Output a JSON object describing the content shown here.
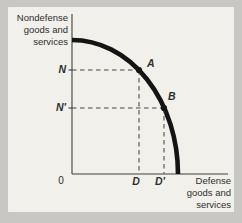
{
  "figure": {
    "y_axis_label": [
      "Nondefense",
      "goods and",
      "services"
    ],
    "x_axis_label": [
      "Defense",
      "goods and",
      "services"
    ],
    "origin_label": "0",
    "y_tick_labels": {
      "n": "N",
      "n_prime": "N'"
    },
    "x_tick_labels": {
      "d": "D",
      "d_prime": "D'"
    },
    "point_labels": {
      "a": "A",
      "b": "B"
    },
    "colors": {
      "curve": "#141414",
      "axis": "#3f3f3f",
      "dash": "#474747",
      "dot": "#141414",
      "panel_bg": "#f1f0ea",
      "outer_bg": "#c8c7c3",
      "text": "#2e2e2e"
    },
    "geometry": {
      "axes": {
        "origin_x": 72,
        "origin_y": 174,
        "y_top": 14,
        "x_right": 228
      },
      "curve": {
        "start_x": 72,
        "start_y": 40,
        "rx": 106,
        "ry": 134,
        "end_x": 178,
        "end_y": 174
      },
      "points": {
        "a": {
          "x": 139,
          "y": 70
        },
        "b": {
          "x": 164,
          "y": 108
        }
      },
      "dot_radius": 3.1,
      "tick_len": 3.5
    }
  },
  "chart_data": {
    "type": "line",
    "title": "",
    "xlabel": "Defense goods and services",
    "ylabel": "Nondefense goods and services",
    "x_ticks": [
      "0",
      "D",
      "D'"
    ],
    "y_ticks": [
      "N",
      "N'"
    ],
    "axis_range_norm": [
      0,
      1
    ],
    "frontier_points_norm": [
      [
        0.0,
        0.84
      ],
      [
        0.17,
        0.81
      ],
      [
        0.33,
        0.73
      ],
      [
        0.43,
        0.65
      ],
      [
        0.52,
        0.53
      ],
      [
        0.59,
        0.41
      ],
      [
        0.64,
        0.28
      ],
      [
        0.68,
        0.0
      ]
    ],
    "marked_points": [
      {
        "label": "A",
        "x_tick": "D",
        "y_tick": "N",
        "x_norm": 0.43,
        "y_norm": 0.65
      },
      {
        "label": "B",
        "x_tick": "D'",
        "y_tick": "N'",
        "x_norm": 0.59,
        "y_norm": 0.41
      }
    ],
    "grid": false,
    "legend": "none"
  }
}
